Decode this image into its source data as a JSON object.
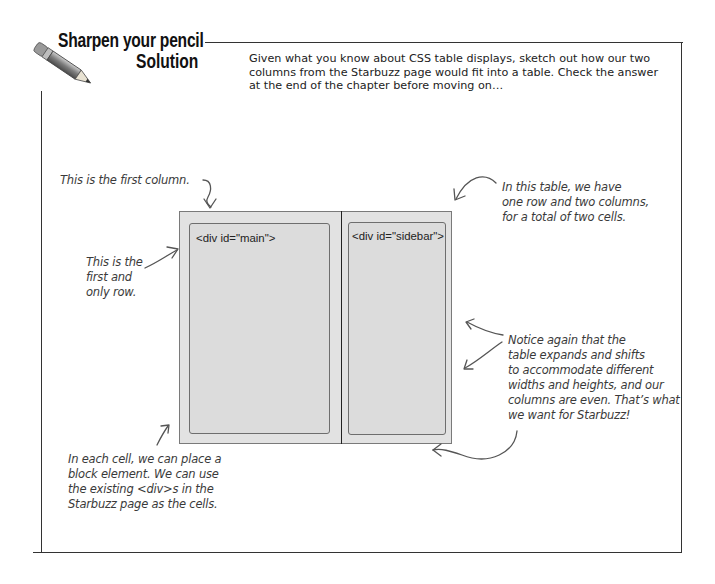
{
  "header": {
    "title_line1": "Sharpen your pencil",
    "title_line2": "Solution",
    "icon": "pencil-icon"
  },
  "intro_text": "Given what you know about CSS table displays, sketch out how our two columns from the Starbuzz page would fit into a table. Check the answer at the end of the chapter before moving on…",
  "diagram": {
    "cells": [
      {
        "label": "<div id=\"main\">"
      },
      {
        "label": "<div id=\"sidebar\">"
      }
    ],
    "colors": {
      "table_bg": "#e2e2e2",
      "cell_bg": "#dcdcdc",
      "border": "#6e6e6e"
    }
  },
  "annotations": {
    "first_column": "This is the first column.",
    "first_row": [
      "This is the",
      "first and",
      "only row."
    ],
    "one_row_two_columns": [
      "In this table, we have",
      "one row and two columns,",
      "for a total of two cells."
    ],
    "expands_shifts": [
      "Notice again that the",
      "table expands and shifts",
      "to accommodate different",
      "widths and heights, and our",
      "columns are even. That’s what",
      "we want for Starbuzz!"
    ],
    "each_cell": [
      "In each cell, we can place a",
      "block element. We can use",
      "the existing <div>s in the",
      "Starbuzz page as the cells."
    ]
  }
}
